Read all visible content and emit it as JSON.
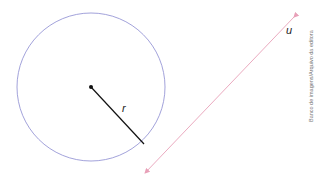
{
  "diagram": {
    "circle": {
      "cx": 91,
      "cy": 87,
      "r": 74,
      "stroke": "#8a8ad0"
    },
    "center_point": {
      "cx": 91,
      "cy": 87
    },
    "radius": {
      "label": "r",
      "x2": 144,
      "y2": 144,
      "stroke": "#111111"
    },
    "line": {
      "label": "u",
      "x1": 294,
      "y1": 17,
      "x2": 145,
      "y2": 173,
      "stroke": "#e8a0b8"
    },
    "credit": "Banco de imagens/Arquivo da editora"
  }
}
